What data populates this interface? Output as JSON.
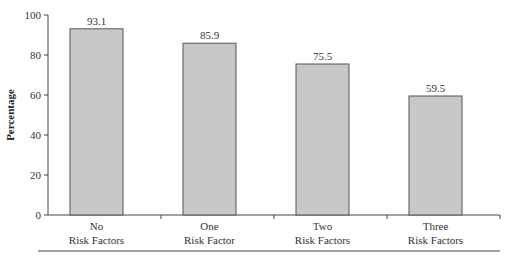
{
  "chart_data": {
    "type": "bar",
    "title": "",
    "xlabel": "",
    "ylabel": "Percentage",
    "ylim": [
      0,
      100
    ],
    "yticks": [
      0,
      20,
      40,
      60,
      80,
      100
    ],
    "grid": false,
    "categories": [
      [
        "No",
        "Risk Factors"
      ],
      [
        "One",
        "Risk Factor"
      ],
      [
        "Two",
        "Risk Factors"
      ],
      [
        "Three",
        "Risk Factors"
      ]
    ],
    "values": [
      93.1,
      85.9,
      75.5,
      59.5
    ],
    "value_labels": [
      "93.1",
      "85.9",
      "75.5",
      "59.5"
    ],
    "bar_color": "#c8c8c8",
    "bar_edge_color": "#555555"
  }
}
